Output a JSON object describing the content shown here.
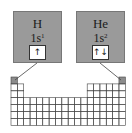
{
  "elements": [
    {
      "symbol": "H",
      "config_base": "1s",
      "config_exp": "1",
      "orbital": "↑"
    },
    {
      "symbol": "He",
      "config_base": "1s",
      "config_exp": "2",
      "orbital": "↑↓"
    }
  ],
  "grid": {
    "columns": 18,
    "rows": 7,
    "highlight_color": "#8c8c8c",
    "box_color": "#9a9a9a"
  }
}
